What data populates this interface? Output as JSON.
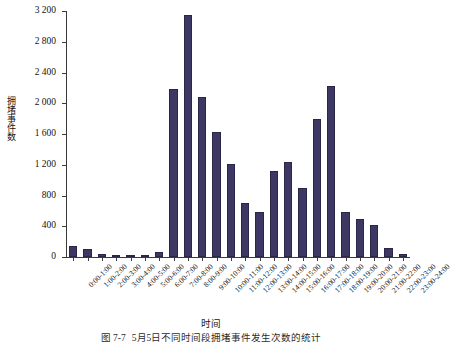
{
  "chart_data": {
    "type": "bar",
    "title": "",
    "xlabel": "时间",
    "ylabel": "拥堵事件数",
    "ylim": [
      0,
      3200
    ],
    "ytick_step": 400,
    "grid": false,
    "legend": null,
    "bar_color": "#3d3863",
    "axis_color": "#3a3a3a",
    "ytick_labels": [
      "0",
      "400",
      "800",
      "1 200",
      "1 600",
      "2 000",
      "2 400",
      "2 800",
      "3 200"
    ],
    "ytick_values": [
      0,
      400,
      800,
      1200,
      1600,
      2000,
      2400,
      2800,
      3200
    ],
    "categories": [
      "0:00-1:00",
      "1:00-2:00",
      "2:00-3:00",
      "3:00-4:00",
      "4:00-5:00",
      "5:00-6:00",
      "6:00-7:00",
      "7:00-8:00",
      "8:00-9:00",
      "9:00-10:00",
      "10:00-11:00",
      "11:00-12:00",
      "12:00-13:00",
      "13:00-14:00",
      "14:00-15:00",
      "15:00-16:00",
      "16:00-17:00",
      "17:00-18:00",
      "18:00-19:00",
      "19:00-20:00",
      "20:00-21:00",
      "21:00-22:00",
      "22:00-23:00",
      "23:00-24:00"
    ],
    "values": [
      140,
      100,
      45,
      10,
      8,
      10,
      60,
      2190,
      3150,
      2080,
      1630,
      1210,
      700,
      590,
      1120,
      1230,
      900,
      1800,
      2230,
      590,
      490,
      420,
      120,
      40
    ]
  },
  "caption": {
    "number": "图 7-7",
    "text": "5月5日不同时间段拥堵事件发生次数的统计"
  }
}
